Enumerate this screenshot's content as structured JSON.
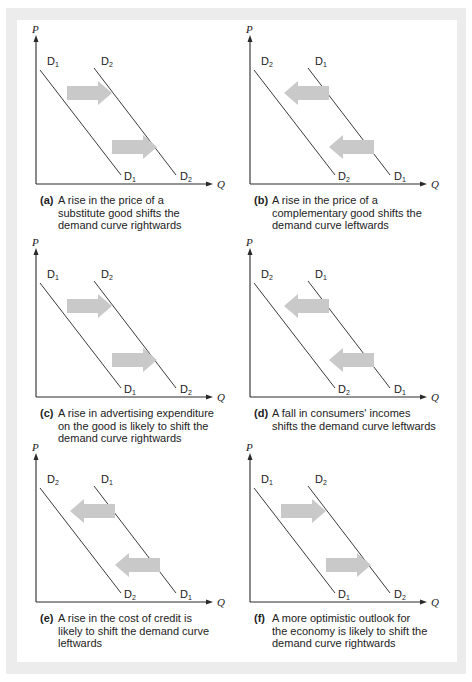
{
  "figure": {
    "frame_color": "#ececec",
    "background": "#ffffff",
    "line_color": "#3a3a3a",
    "arrow_color": "#c9c9c9",
    "axis": {
      "y_label": "P",
      "x_label": "Q"
    },
    "panels": [
      {
        "id": "a",
        "tag": "(a)",
        "caption_lines": [
          "A rise in the price of a",
          "substitute good shifts the",
          "demand curve rightwards"
        ],
        "direction": "right",
        "left_curve": {
          "label": "D",
          "sub": "1"
        },
        "right_curve": {
          "label": "D",
          "sub": "2"
        }
      },
      {
        "id": "b",
        "tag": "(b)",
        "caption_lines": [
          "A rise in the price of a",
          "complementary good shifts the",
          "demand curve leftwards"
        ],
        "direction": "left",
        "left_curve": {
          "label": "D",
          "sub": "2"
        },
        "right_curve": {
          "label": "D",
          "sub": "1"
        }
      },
      {
        "id": "c",
        "tag": "(c)",
        "caption_lines": [
          "A rise in advertising expenditure",
          "on the good is likely to shift the",
          "demand curve rightwards"
        ],
        "direction": "right",
        "left_curve": {
          "label": "D",
          "sub": "1"
        },
        "right_curve": {
          "label": "D",
          "sub": "2"
        }
      },
      {
        "id": "d",
        "tag": "(d)",
        "caption_lines": [
          "A fall in consumers' incomes",
          "shifts the demand curve leftwards"
        ],
        "direction": "left",
        "left_curve": {
          "label": "D",
          "sub": "2"
        },
        "right_curve": {
          "label": "D",
          "sub": "1"
        }
      },
      {
        "id": "e",
        "tag": "(e)",
        "caption_lines": [
          "A rise in the cost of credit is",
          "likely to shift the demand curve",
          "leftwards"
        ],
        "direction": "left",
        "left_curve": {
          "label": "D",
          "sub": "2"
        },
        "right_curve": {
          "label": "D",
          "sub": "1"
        }
      },
      {
        "id": "f",
        "tag": "(f)",
        "caption_lines": [
          "A more optimistic outlook for",
          "the economy is likely to shift the",
          "demand curve rightwards"
        ],
        "direction": "right",
        "left_curve": {
          "label": "D",
          "sub": "1"
        },
        "right_curve": {
          "label": "D",
          "sub": "2"
        }
      }
    ]
  }
}
